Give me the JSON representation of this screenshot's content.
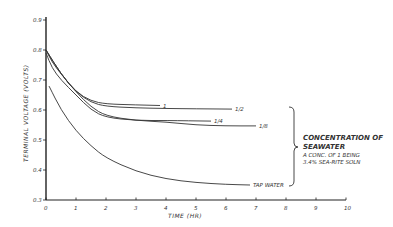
{
  "chart_data": {
    "type": "line",
    "title": "",
    "xlabel": "TIME (HR)",
    "ylabel": "TERMINAL VOLTAGE (VOLTS)",
    "xlim": [
      0,
      10
    ],
    "ylim": [
      0.3,
      0.9
    ],
    "xticks": [
      "0",
      "1",
      "2",
      "3",
      "4",
      "5",
      "6",
      "7",
      "8",
      "9",
      "10"
    ],
    "yticks": [
      "0.3",
      "0.4",
      "0.5",
      "0.6",
      "0.7",
      "0.8",
      "0.9"
    ],
    "grid": false,
    "series": [
      {
        "name": "1",
        "x": [
          0,
          0.5,
          1.0,
          1.5,
          2.0,
          3.0,
          3.8
        ],
        "values": [
          0.8,
          0.72,
          0.66,
          0.63,
          0.62,
          0.617,
          0.615
        ]
      },
      {
        "name": "1/2",
        "x": [
          0,
          0.5,
          1.0,
          1.5,
          2.0,
          3.0,
          4.0,
          5.0,
          6.2
        ],
        "values": [
          0.8,
          0.72,
          0.66,
          0.625,
          0.612,
          0.607,
          0.605,
          0.604,
          0.603
        ]
      },
      {
        "name": "1/4",
        "x": [
          0,
          0.2,
          0.5,
          1.0,
          1.5,
          2.0,
          3.0,
          4.0,
          5.5
        ],
        "values": [
          0.79,
          0.74,
          0.7,
          0.65,
          0.6,
          0.575,
          0.565,
          0.565,
          0.563
        ]
      },
      {
        "name": "1/8",
        "x": [
          0,
          0.2,
          0.5,
          1.0,
          1.5,
          2.0,
          3.0,
          4.0,
          5.0,
          6.0,
          7.0
        ],
        "values": [
          0.8,
          0.76,
          0.72,
          0.66,
          0.61,
          0.58,
          0.565,
          0.56,
          0.55,
          0.547,
          0.547
        ]
      },
      {
        "name": "TAP WATER",
        "x": [
          0.1,
          0.5,
          1.0,
          1.5,
          2.0,
          3.0,
          4.0,
          5.0,
          6.0,
          6.8
        ],
        "values": [
          0.68,
          0.6,
          0.53,
          0.48,
          0.44,
          0.395,
          0.37,
          0.358,
          0.352,
          0.35
        ]
      }
    ],
    "annotations": {
      "brace_label_title": "CONCENTRATION OF SEAWATER",
      "brace_label_line1": "A CONC. OF 1 BEING",
      "brace_label_line2": "3.4% SEA-RITE SOLN"
    }
  },
  "labels": {
    "xlabel": "TIME (HR)",
    "ylabel": "TERMINAL VOLTAGE (VOLTS)",
    "annot_title_1": "CONCENTRATION OF",
    "annot_title_2": "SEAWATER",
    "annot_sub_1": "A CONC. OF 1 BEING",
    "annot_sub_2": "3.4% SEA-RITE SOLN",
    "s1": "1",
    "s2": "1/2",
    "s3": "1/4",
    "s4": "1/8",
    "s5": "TAP WATER"
  }
}
